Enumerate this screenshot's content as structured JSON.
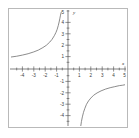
{
  "chart_data": {
    "type": "line",
    "title": "",
    "subtitle": "",
    "xlabel": "x",
    "ylabel": "y",
    "xlim": [
      -5,
      5
    ],
    "ylim": [
      -5,
      5
    ],
    "grid": false,
    "legend": null,
    "x_ticks": [
      -4,
      -3,
      -2,
      -1,
      1,
      2,
      3,
      4,
      5
    ],
    "y_ticks": [
      -4,
      -3,
      -2,
      -1,
      1,
      2,
      3,
      4,
      5
    ],
    "x_tick_labels": [
      "-4",
      "-3",
      "-2",
      "-1",
      "1",
      "2",
      "3",
      "4",
      "5"
    ],
    "y_tick_labels": [
      "-4",
      "-3",
      "-2",
      "-1",
      "1",
      "2",
      "3",
      "4",
      "5"
    ],
    "asymptotes": {
      "vertical_x": -0.4,
      "horizontal_y_right_branch": -1,
      "horizontal_y_left_branch": 0
    },
    "series": [
      {
        "name": "left-branch",
        "x": [
          -5.0,
          -4.5,
          -4.0,
          -3.5,
          -3.0,
          -2.6,
          -2.2,
          -1.9,
          -1.6,
          -1.4,
          -1.2,
          -1.05,
          -0.95,
          -0.85,
          -0.78,
          -0.72,
          -0.67,
          -0.63,
          -0.6,
          -0.575,
          -0.555
        ],
        "y": [
          1.05,
          1.12,
          1.22,
          1.34,
          1.5,
          1.66,
          1.88,
          2.08,
          2.36,
          2.6,
          2.92,
          3.22,
          3.48,
          3.82,
          4.12,
          4.4,
          4.66,
          4.86,
          4.98,
          5.0,
          5.0
        ]
      },
      {
        "name": "right-branch",
        "x": [
          1.12,
          1.18,
          1.26,
          1.36,
          1.48,
          1.62,
          1.8,
          2.0,
          2.25,
          2.55,
          2.9,
          3.3,
          3.7,
          4.1,
          4.5,
          4.8,
          5.0
        ],
        "y": [
          -5.0,
          -4.6,
          -4.2,
          -3.8,
          -3.45,
          -3.1,
          -2.8,
          -2.55,
          -2.3,
          -2.1,
          -1.92,
          -1.76,
          -1.64,
          -1.55,
          -1.46,
          -1.42,
          -1.38
        ]
      }
    ]
  }
}
